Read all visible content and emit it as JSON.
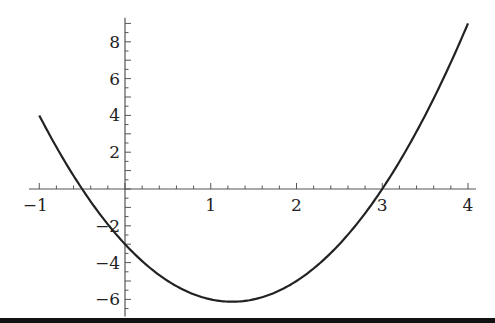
{
  "chart_data": {
    "type": "line",
    "title": "",
    "xlabel": "",
    "ylabel": "",
    "function": "y = 2x^2 - 5x - 3",
    "xlim": [
      -1,
      4
    ],
    "ylim": [
      -6.5,
      9.2
    ],
    "x_ticks": [
      -1,
      1,
      2,
      3,
      4
    ],
    "x_tick_labels": [
      "−1",
      "1",
      "2",
      "3",
      "4"
    ],
    "y_ticks": [
      8,
      6,
      4,
      2,
      -2,
      -4,
      -6
    ],
    "y_tick_labels": [
      "8",
      "6",
      "4",
      "2",
      "−2",
      "−4",
      "−6"
    ],
    "x_minor_step": 0.2,
    "y_minor_step": 0.5,
    "grid": false,
    "series": [
      {
        "name": "f(x)",
        "color": "#222222",
        "x": [
          -1,
          -0.5,
          0,
          0.5,
          1,
          1.25,
          1.5,
          2,
          2.5,
          3,
          3.5,
          4
        ],
        "values": [
          4,
          0,
          -3,
          -5,
          -6,
          -6.125,
          -6,
          -5,
          -3,
          0,
          4,
          9
        ]
      }
    ],
    "roots": [
      -0.5,
      3
    ],
    "minimum": {
      "x": 1.25,
      "y": -6.125
    }
  },
  "layout": {
    "origin_px": [
      125,
      189
    ],
    "x_scale_px": 85.75,
    "y_scale_px": 18.4,
    "axis_color": "#555555",
    "curve_color": "#222222"
  }
}
